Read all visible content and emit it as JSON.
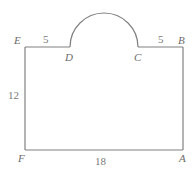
{
  "figure": {
    "stroke_color": "#808080",
    "label_color": "#6b6b6b",
    "background": "#ffffff",
    "vertices": [
      {
        "id": "E",
        "label": "E",
        "x": 25,
        "y": 47
      },
      {
        "id": "D",
        "label": "D",
        "x": 70,
        "y": 47
      },
      {
        "id": "C",
        "label": "C",
        "x": 138,
        "y": 47
      },
      {
        "id": "B",
        "label": "B",
        "x": 183,
        "y": 47
      },
      {
        "id": "A",
        "label": "A",
        "x": 183,
        "y": 150
      },
      {
        "id": "F",
        "label": "F",
        "x": 25,
        "y": 150
      }
    ],
    "measurements": [
      {
        "id": "ED",
        "value": "5",
        "segment": "E-D"
      },
      {
        "id": "CB",
        "value": "5",
        "segment": "C-B"
      },
      {
        "id": "EF",
        "value": "12",
        "segment": "E-F"
      },
      {
        "id": "FA",
        "value": "18",
        "segment": "F-A"
      }
    ],
    "arc": {
      "type": "semicircle",
      "from": "D",
      "to": "C",
      "center_x": 104,
      "radius": 34,
      "apex_y": 13,
      "direction": "upward"
    }
  }
}
